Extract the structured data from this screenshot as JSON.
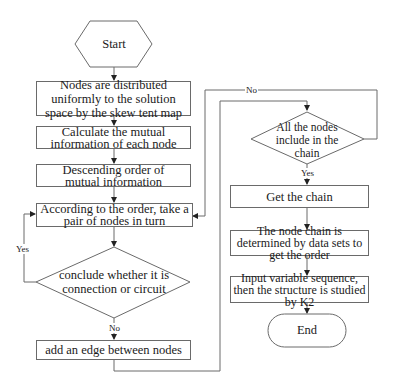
{
  "flowchart": {
    "start": "Start",
    "end": "End",
    "left_column": [
      {
        "id": "distribute",
        "text": "Nodes are distributed uniformly to the solution space by the skew tent map"
      },
      {
        "id": "calc_mi",
        "text": "Calculate the mutual information of each node"
      },
      {
        "id": "sort_mi",
        "text": "Descending order of mutual information"
      },
      {
        "id": "take_pair",
        "text": "According to the order, take a pair of nodes in turn"
      },
      {
        "id": "add_edge",
        "text": "add  an edge between nodes"
      }
    ],
    "decision_1": {
      "text": "conclude whether it is connection or circuit",
      "yes_label": "Yes",
      "no_label": "No"
    },
    "decision_2": {
      "text": "All the nodes include in the chain",
      "yes_label": "Yes",
      "no_label": "No"
    },
    "right_column": [
      {
        "id": "get_chain",
        "text": "Get the chain"
      },
      {
        "id": "determine_order",
        "text": "The node chain is determined by data sets to get the order"
      },
      {
        "id": "k2",
        "text": "Input variable sequence, then the structure is studied by K2"
      }
    ]
  },
  "colors": {
    "line": "#6a6a6a",
    "text": "#1a1a1a",
    "background": "#ffffff"
  }
}
